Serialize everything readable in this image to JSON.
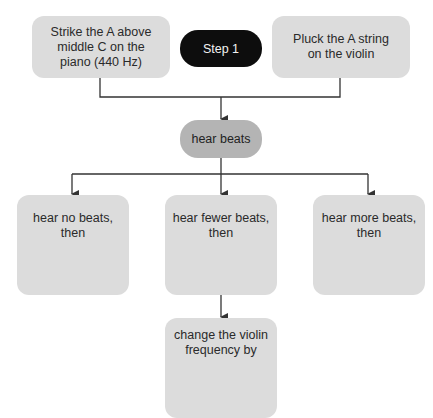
{
  "diagram": {
    "nodes": {
      "strike_piano": "Strike the A above middle C on the piano (440 Hz)",
      "step_label": "Step 1",
      "pluck_violin": "Pluck the A string on the violin",
      "hear_beats": "hear beats",
      "no_beats": "hear no beats, then",
      "fewer_beats": "hear fewer beats, then",
      "more_beats": "hear more beats, then",
      "change_freq": "change the violin frequency by"
    },
    "edges": [
      [
        "strike_piano",
        "hear_beats"
      ],
      [
        "pluck_violin",
        "hear_beats"
      ],
      [
        "hear_beats",
        "no_beats"
      ],
      [
        "hear_beats",
        "fewer_beats"
      ],
      [
        "hear_beats",
        "more_beats"
      ],
      [
        "fewer_beats",
        "change_freq"
      ]
    ],
    "colors": {
      "box_fill": "#dcdcdc",
      "step_fill": "#0d0d0d",
      "hear_beats_fill": "#b4b4b4",
      "line": "#333333"
    }
  }
}
